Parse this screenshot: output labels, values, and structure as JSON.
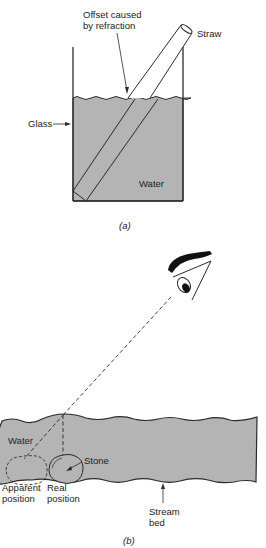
{
  "figure_a": {
    "labels": {
      "offset_line1": "Offset caused",
      "offset_line2": "by refraction",
      "straw": "Straw",
      "glass": "Glass",
      "water": "Water"
    },
    "caption": "(a)"
  },
  "figure_b": {
    "labels": {
      "water": "Water",
      "stone": "Stone",
      "apparent_line1": "Apparent",
      "apparent_line2": "position",
      "real_line1": "Real",
      "real_line2": "position",
      "stream_line1": "Stream",
      "stream_line2": "bed"
    },
    "caption": "(b)"
  },
  "colors": {
    "water_fill": "#b4b4b4",
    "line": "#2a2a2a",
    "background": "#ffffff"
  }
}
